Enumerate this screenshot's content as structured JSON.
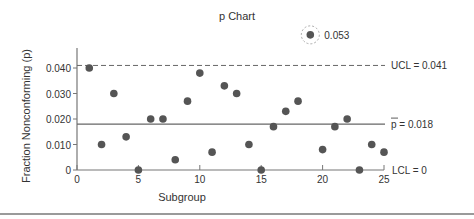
{
  "chart_data": {
    "type": "scatter",
    "title": "p Chart",
    "xlabel": "Subgroup",
    "ylabel": "Fraction Nonconforming (p)",
    "xlim": [
      0,
      25
    ],
    "ylim": [
      0,
      0.045
    ],
    "x_ticks": [
      0,
      5,
      10,
      15,
      20,
      25
    ],
    "y_ticks": [
      0,
      0.01,
      0.02,
      0.03,
      0.04
    ],
    "y_tick_labels": [
      "0",
      "0.010",
      "0.020",
      "0.030",
      "0.040"
    ],
    "x": [
      1,
      2,
      3,
      4,
      5,
      6,
      7,
      8,
      9,
      10,
      11,
      12,
      13,
      14,
      15,
      16,
      17,
      18,
      19,
      20,
      21,
      22,
      23,
      24,
      25
    ],
    "values": [
      0.04,
      0.01,
      0.03,
      0.013,
      0.0,
      0.02,
      0.02,
      0.004,
      0.027,
      0.038,
      0.007,
      0.033,
      0.03,
      0.01,
      0.0,
      0.017,
      0.023,
      0.027,
      0.053,
      0.008,
      0.017,
      0.02,
      0.0,
      0.01,
      0.007
    ],
    "control_lines": [
      {
        "name": "UCL",
        "value": 0.041,
        "label": "UCL = 0.041",
        "style": "dashed"
      },
      {
        "name": "p-bar",
        "value": 0.018,
        "label": "p = 0.018",
        "style": "solid"
      },
      {
        "name": "LCL",
        "value": 0,
        "label": "LCL = 0",
        "style": "solid"
      }
    ],
    "annotations": [
      {
        "x": 19,
        "y": 0.053,
        "text": "0.053",
        "highlight": "dashed-circle"
      }
    ],
    "grid": false,
    "legend": null
  }
}
